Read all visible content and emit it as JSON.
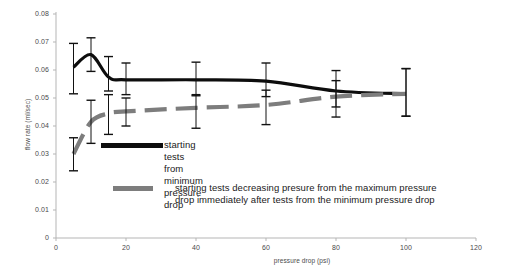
{
  "chart_data": {
    "type": "line",
    "title": "",
    "xlabel": "pressure drop (psi)",
    "ylabel": "flow rate (ml/sec)",
    "xlim": [
      0,
      120
    ],
    "ylim": [
      0,
      0.08
    ],
    "xticks": [
      0,
      20,
      40,
      60,
      80,
      100,
      120
    ],
    "yticks": [
      0,
      0.01,
      0.02,
      0.03,
      0.04,
      0.05,
      0.06,
      0.07,
      0.08
    ],
    "xtick_labels": [
      "0",
      "20",
      "40",
      "60",
      "80",
      "100",
      "120"
    ],
    "ytick_labels": [
      "0",
      "0.01",
      "0.02",
      "0.03",
      "0.04",
      "0.05",
      "0.06",
      "0.07",
      "0.08"
    ],
    "grid": false,
    "legend_position": "inside-center",
    "series": [
      {
        "name": "starting tests from minimum pressure drop",
        "color": "#0d0d0d",
        "style": "solid",
        "x": [
          5,
          10,
          15,
          20,
          40,
          60,
          80,
          100
        ],
        "values": [
          0.061,
          0.0655,
          0.0575,
          0.0565,
          0.0565,
          0.056,
          0.0525,
          0.0515
        ],
        "yerr_low": [
          0.0515,
          0.0595,
          0.0525,
          0.0512,
          0.0508,
          0.0505,
          0.0468,
          0.0435
        ],
        "yerr_high": [
          0.0695,
          0.0715,
          0.0648,
          0.0625,
          0.0628,
          0.0625,
          0.0598,
          0.0605
        ]
      },
      {
        "name": "starting tests decreasing presure from the maximum pressure drop immediately after tests from the minimum pressure drop",
        "color": "#7d7d7d",
        "style": "dashed",
        "x": [
          5,
          10,
          15,
          20,
          40,
          60,
          80,
          100
        ],
        "values": [
          0.03,
          0.0415,
          0.0445,
          0.0452,
          0.0465,
          0.0475,
          0.0505,
          0.0515
        ],
        "yerr_low": [
          0.024,
          0.0338,
          0.037,
          0.04,
          0.0392,
          0.0405,
          0.0432,
          0.0435
        ],
        "yerr_high": [
          0.0358,
          0.0492,
          0.0512,
          0.05,
          0.0512,
          0.0528,
          0.0562,
          0.0605
        ]
      }
    ]
  },
  "legend": {
    "item1": "starting tests from minimum pressure drop",
    "item2_line1": "starting tests decreasing presure from the maximum pressure",
    "item2_line2": "drop immediately after tests from the minimum pressure drop"
  },
  "colors": {
    "series_black": "#0d0d0d",
    "series_gray": "#7d7d7d",
    "axis": "#b5b5b5",
    "text": "#4a4a4a"
  }
}
